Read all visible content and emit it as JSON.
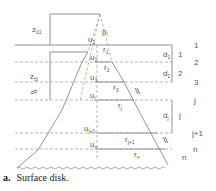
{
  "caption": {
    "label": "a.",
    "text": "Surface disk."
  },
  "diagram": {
    "apex_label": "p",
    "apex_sub": "i",
    "left_dims": [
      {
        "label": "z",
        "sub": "01"
      },
      {
        "label": "z",
        "sub": "0j"
      }
    ],
    "layers": [
      {
        "index_label": "1",
        "d_label": "d",
        "d_sub": "1",
        "mid_label": "1",
        "u_label": "u",
        "u_sub": "1",
        "r_label": "r",
        "r_sub": "1"
      },
      {
        "index_label": "2",
        "d_label": "d",
        "d_sub": "2",
        "mid_label": "2",
        "u_label": "u",
        "u_sub": "2",
        "r_label": "r",
        "r_sub": "2"
      },
      {
        "index_label": "3",
        "u_label": "u",
        "u_sub": "3",
        "r_label": "r",
        "r_sub": "3"
      },
      {
        "index_label": "j",
        "d_label": "d",
        "d_sub": "j",
        "mid_label": "j",
        "u_label": "u",
        "u_sub": "j",
        "r_label": "r",
        "r_sub": "j"
      },
      {
        "index_label": "j+1",
        "u_label": "u",
        "u_sub": "j+1",
        "r_label": "r",
        "r_sub": "j+1"
      },
      {
        "index_label": "n",
        "u_label": "u",
        "u_sub": "n",
        "r_label": "r",
        "r_sub": "n",
        "side_label": "n"
      }
    ],
    "colors": {
      "line": "#777777",
      "dashed": "#999999",
      "text": "#555555"
    }
  }
}
